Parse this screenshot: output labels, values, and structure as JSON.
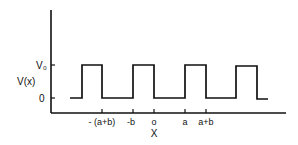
{
  "diagram": {
    "title": "",
    "y_axis_label": "V(x)",
    "x_axis_label": "X",
    "y_levels": [
      {
        "label": "V₀",
        "y": 65
      },
      {
        "label": "0",
        "y": 98
      }
    ],
    "x_ticks": [
      {
        "label": "- (a+b)",
        "x": 102
      },
      {
        "label": "-b",
        "x": 133
      },
      {
        "label": "o",
        "x": 154
      },
      {
        "label": "a",
        "x": 185
      },
      {
        "label": "a+b",
        "x": 206
      }
    ],
    "waveform": "periodic square wave alternating between 0 and V₀",
    "stroke_color": "#111111"
  }
}
